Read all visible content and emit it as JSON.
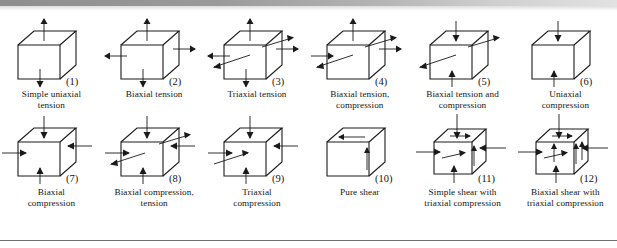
{
  "figure": {
    "background_color": "#ffffff",
    "ink_color": "#1a1a1a",
    "top_band_color": "#8e8e8e",
    "rule_color": "#6f6f6f",
    "rows": [
      {
        "row_id": "row-1",
        "cells": [
          {
            "number": "(1)",
            "caption_lines": [
              "Simple uniaxial",
              "tension"
            ],
            "stress_state": "simple-uniaxial-tension"
          },
          {
            "number": "(2)",
            "caption_lines": [
              "Biaxial tension"
            ],
            "stress_state": "biaxial-tension"
          },
          {
            "number": "(3)",
            "caption_lines": [
              "Triaxial tension"
            ],
            "stress_state": "triaxial-tension"
          },
          {
            "number": "(4)",
            "caption_lines": [
              "Biaxial tension,",
              "compression"
            ],
            "stress_state": "biaxial-tension-compression"
          },
          {
            "number": "(5)",
            "caption_lines": [
              "Biaxial tension and",
              "compression"
            ],
            "stress_state": "biaxial-tension-and-compression"
          },
          {
            "number": "(6)",
            "caption_lines": [
              "Uniaxial",
              "compression"
            ],
            "stress_state": "uniaxial-compression"
          }
        ]
      },
      {
        "row_id": "row-2",
        "cells": [
          {
            "number": "(7)",
            "caption_lines": [
              "Biaxial",
              "compression"
            ],
            "stress_state": "biaxial-compression"
          },
          {
            "number": "(8)",
            "caption_lines": [
              "Biaxial compression,",
              "tension"
            ],
            "stress_state": "biaxial-compression-tension"
          },
          {
            "number": "(9)",
            "caption_lines": [
              "Triaxial",
              "compression"
            ],
            "stress_state": "triaxial-compression"
          },
          {
            "number": "(10)",
            "caption_lines": [
              "Pure shear"
            ],
            "stress_state": "pure-shear"
          },
          {
            "number": "(11)",
            "caption_lines": [
              "Simple shear with",
              "triaxial compression"
            ],
            "stress_state": "simple-shear-triaxial-compression"
          },
          {
            "number": "(12)",
            "caption_lines": [
              "Biaxial shear with",
              "triaxial compression"
            ],
            "stress_state": "biaxial-shear-triaxial-compression"
          }
        ]
      }
    ]
  }
}
